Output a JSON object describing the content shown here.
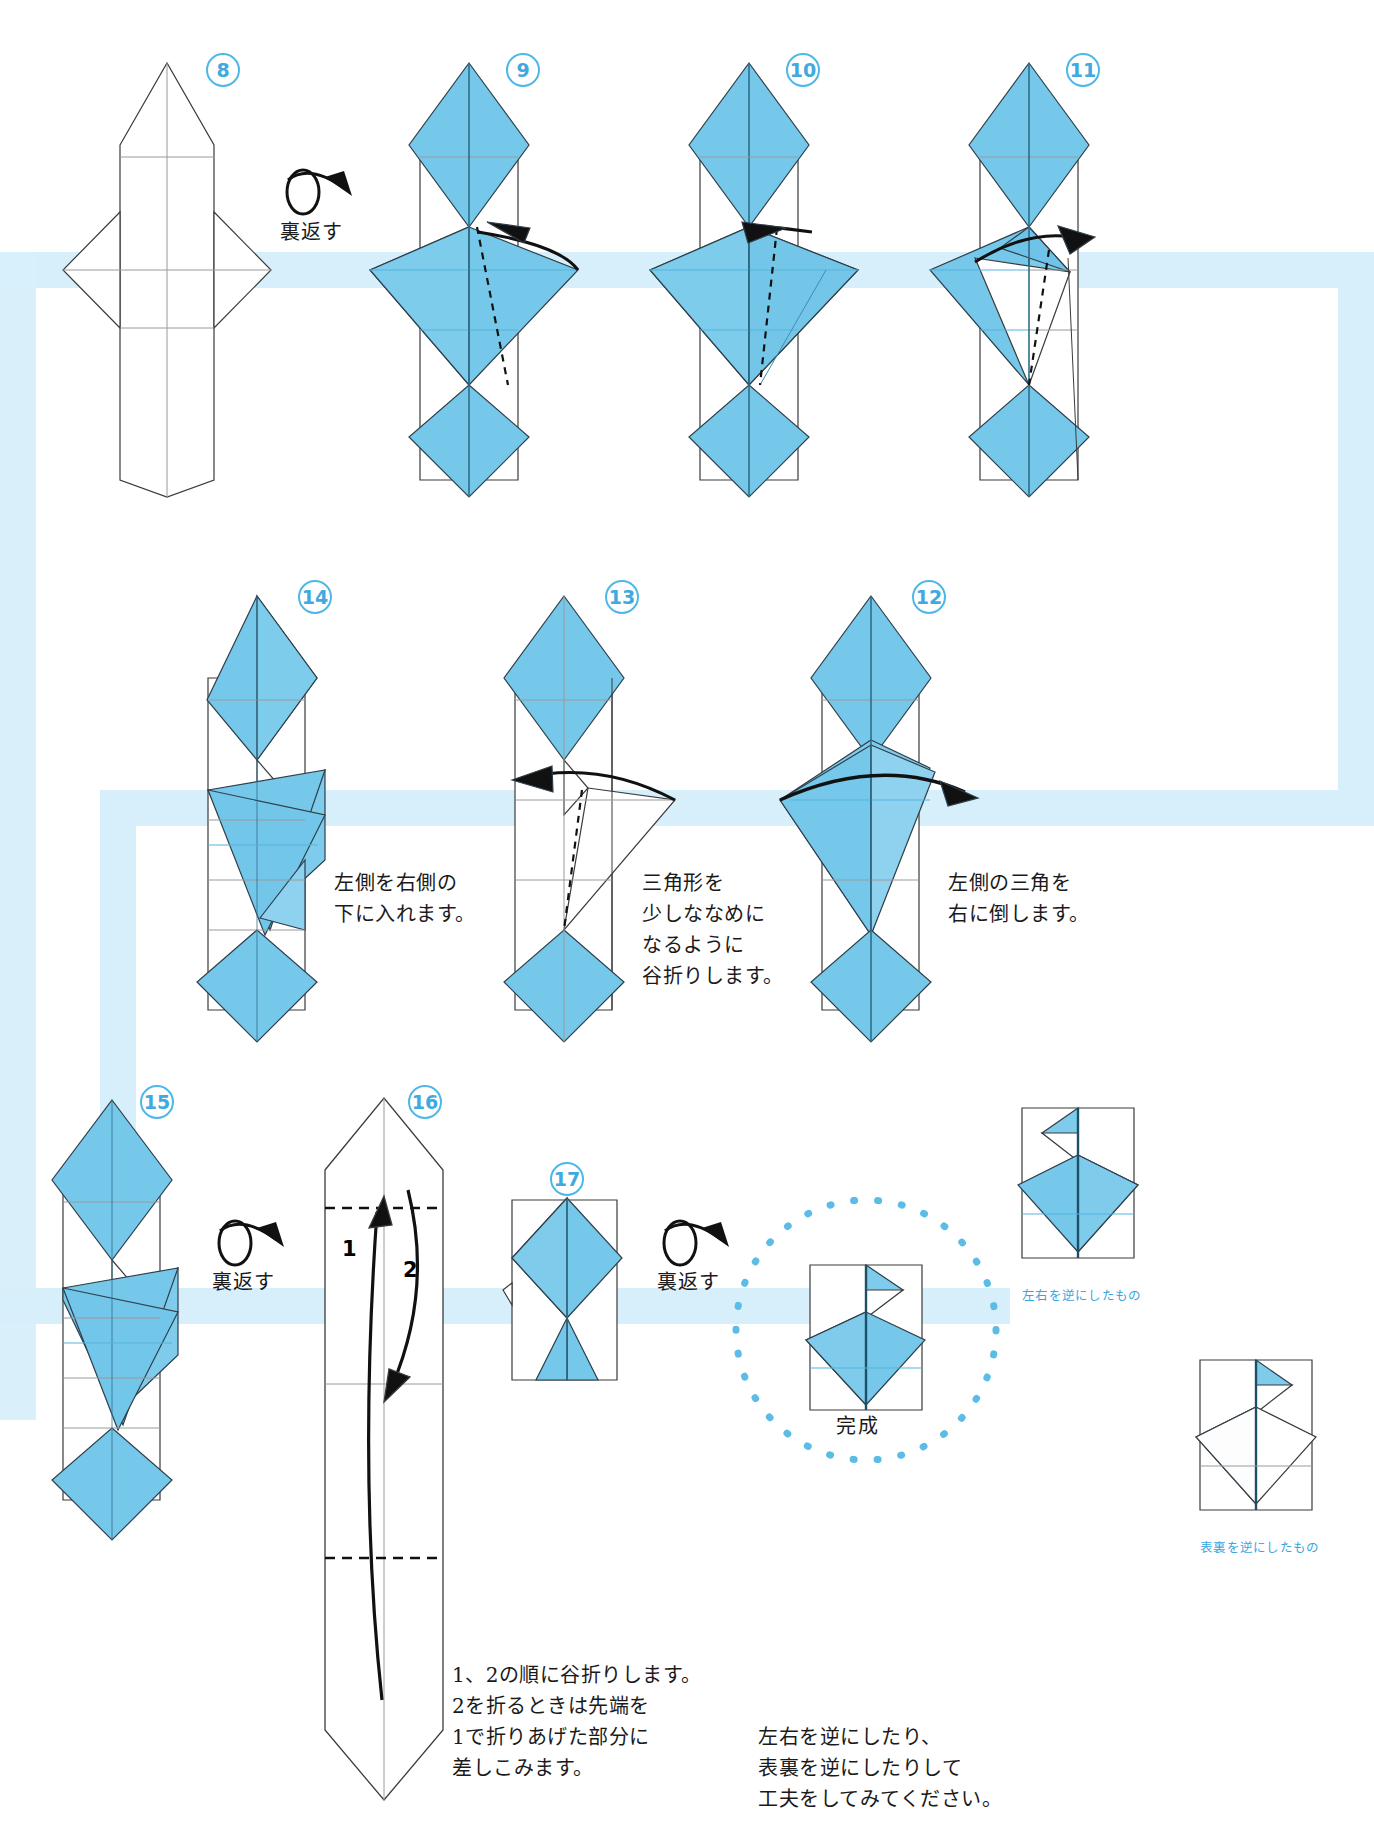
{
  "page": {
    "background_color": "#ffffff",
    "paper_color": "#72c7ea",
    "paper_color_light": "#9fd9f2",
    "accent_color": "#4db8e8",
    "band_color": "#d7effb",
    "line_color": "#3b3b3b",
    "crease_color": "#9a9a9a"
  },
  "steps": [
    {
      "id": "8",
      "number": "8"
    },
    {
      "id": "9",
      "number": "9"
    },
    {
      "id": "10",
      "number": "10"
    },
    {
      "id": "11",
      "number": "11"
    },
    {
      "id": "14",
      "number": "14"
    },
    {
      "id": "13",
      "number": "13"
    },
    {
      "id": "12",
      "number": "12"
    },
    {
      "id": "15",
      "number": "15"
    },
    {
      "id": "16",
      "number": "16"
    },
    {
      "id": "17",
      "number": "17"
    }
  ],
  "turn_over_labels": {
    "row1": "裏返す",
    "row3_a": "裏返す",
    "row3_b": "裏返す"
  },
  "captions": {
    "step14": "左側を右側の\n下に入れます。",
    "step13": "三角形を\n少しななめに\nなるように\n谷折りします。",
    "step12": "左側の三角を\n右に倒します。",
    "step16": "1、2の順に谷折りします。\n2を折るときは先端を\n1で折りあげた部分に\n差しこみます。",
    "final": "左右を逆にしたり、\n表裏を逆にしたりして\n工夫をしてみてください。"
  },
  "fold_order_labels": {
    "one": "1",
    "two": "2"
  },
  "completed_label": "完成",
  "variant_labels": {
    "mirror": "左右を逆にしたもの",
    "reverse": "表裏を逆にしたもの"
  }
}
